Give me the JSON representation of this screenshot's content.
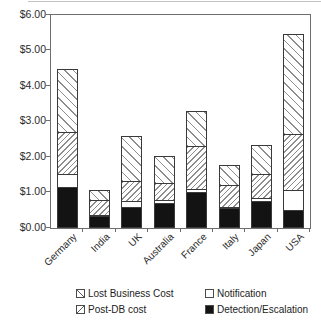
{
  "chart_data": {
    "type": "bar",
    "stacked": true,
    "title": "",
    "xlabel": "",
    "ylabel": "",
    "categories": [
      "Germany",
      "India",
      "UK",
      "Australia",
      "France",
      "Italy",
      "Japan",
      "USA"
    ],
    "series": [
      {
        "name": "Detection/Escalation",
        "pattern": "solid",
        "values": [
          1.15,
          0.35,
          0.6,
          0.7,
          1.0,
          0.55,
          0.75,
          0.5
        ]
      },
      {
        "name": "Notification",
        "pattern": "white",
        "values": [
          0.4,
          0.05,
          0.2,
          0.1,
          0.1,
          0.05,
          0.1,
          0.6
        ]
      },
      {
        "name": "Post-DB cost",
        "pattern": "slash",
        "values": [
          1.2,
          0.45,
          0.6,
          0.5,
          1.25,
          0.65,
          0.7,
          1.6
        ]
      },
      {
        "name": "Lost Business Cost",
        "pattern": "backslash",
        "values": [
          1.8,
          0.3,
          1.3,
          0.8,
          1.0,
          0.6,
          0.85,
          2.85
        ]
      }
    ],
    "totals": [
      4.55,
      1.15,
      2.7,
      2.1,
      3.35,
      1.85,
      2.4,
      5.55
    ],
    "ylim": [
      0,
      6
    ],
    "ytick_labels": [
      "$0.00",
      "$1.00",
      "$2.00",
      "$3.00",
      "$4.00",
      "$5.00",
      "$6.00"
    ],
    "grid": "off",
    "legend_position": "bottom"
  },
  "legend": {
    "items": [
      {
        "label": "Lost Business Cost",
        "pattern": "backslash"
      },
      {
        "label": "Notification",
        "pattern": "empty"
      },
      {
        "label": "Post-DB cost",
        "pattern": "slash"
      },
      {
        "label": "Detection/Escalation",
        "pattern": "solid"
      }
    ]
  },
  "colors": {
    "background": "#ffffff",
    "axis": "#6e6e6e",
    "segment_border": "#3a3a3a",
    "hatch_line": "#8d8d8d",
    "solid_fill": "#131313",
    "text": "#2b2b2b"
  }
}
